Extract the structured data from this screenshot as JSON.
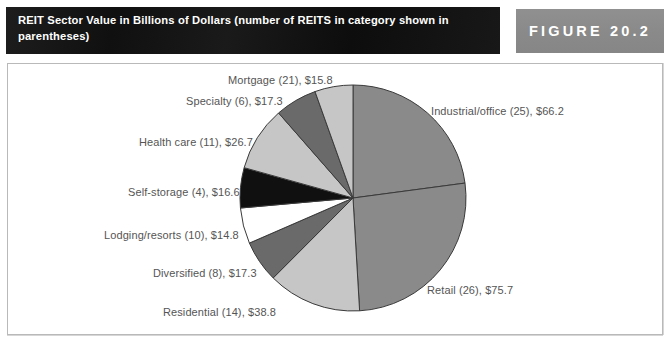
{
  "header": {
    "title": "REIT Sector Value in Billions of Dollars (number of REITS in category shown in parentheses)",
    "figure_label": "FIGURE 20.2"
  },
  "colors": {
    "title_bar": "#151515",
    "figure_box": "#8c8c8c",
    "frame_border": "#b9b9b9",
    "label_text": "#555555",
    "slice_stroke": "#3a3a3a",
    "medium_gray": "#8a8a8a",
    "light_gray": "#c6c6c6",
    "dark_gray": "#6a6a6a",
    "black": "#101010",
    "white": "#ffffff"
  },
  "labels": {
    "industrial": "Industrial/office (25), $66.2",
    "retail": "Retail (26), $75.7",
    "residential": "Residential (14), $38.8",
    "diversified": "Diversified (8), $17.3",
    "lodging": "Lodging/resorts (10), $14.8",
    "selfstorage": "Self-storage (4), $16.6",
    "healthcare": "Health care (11), $26.7",
    "specialty": "Specialty (6), $17.3",
    "mortgage": "Mortgage (21), $15.8"
  },
  "chart_data": {
    "type": "pie",
    "title": "REIT Sector Value in Billions of Dollars (number of REITS in category shown in parentheses)",
    "unit": "billions of dollars",
    "total": 289.2,
    "legend": "none (direct labels with leader placement)",
    "start_angle_deg": 0,
    "direction": "clockwise",
    "categories": [
      "Industrial/office",
      "Retail",
      "Residential",
      "Diversified",
      "Lodging/resorts",
      "Self-storage",
      "Health care",
      "Specialty",
      "Mortgage"
    ],
    "values": [
      66.2,
      75.7,
      38.8,
      17.3,
      14.8,
      16.6,
      26.7,
      17.3,
      15.8
    ],
    "counts": [
      25,
      26,
      14,
      8,
      10,
      4,
      11,
      6,
      21
    ],
    "slices": [
      {
        "name": "Industrial/office",
        "count": 25,
        "value": 66.2,
        "label": "Industrial/office (25), $66.2",
        "color": "#8a8a8a",
        "start_deg": 0.0,
        "sweep_deg": 82.41
      },
      {
        "name": "Retail",
        "count": 26,
        "value": 75.7,
        "label": "Retail (26), $75.7",
        "color": "#8a8a8a",
        "start_deg": 82.41,
        "sweep_deg": 94.24
      },
      {
        "name": "Residential",
        "count": 14,
        "value": 38.8,
        "label": "Residential (14), $38.8",
        "color": "#c6c6c6",
        "start_deg": 176.65,
        "sweep_deg": 48.3
      },
      {
        "name": "Diversified",
        "count": 8,
        "value": 17.3,
        "label": "Diversified (8), $17.3",
        "color": "#6a6a6a",
        "start_deg": 224.95,
        "sweep_deg": 21.54
      },
      {
        "name": "Lodging/resorts",
        "count": 10,
        "value": 14.8,
        "label": "Lodging/resorts (10), $14.8",
        "color": "#ffffff",
        "start_deg": 246.49,
        "sweep_deg": 18.42
      },
      {
        "name": "Self-storage",
        "count": 4,
        "value": 16.6,
        "label": "Self-storage (4), $16.6",
        "color": "#101010",
        "start_deg": 264.91,
        "sweep_deg": 20.66
      },
      {
        "name": "Health care",
        "count": 11,
        "value": 26.7,
        "label": "Health care (11), $26.7",
        "color": "#c6c6c6",
        "start_deg": 285.57,
        "sweep_deg": 33.24
      },
      {
        "name": "Specialty",
        "count": 6,
        "value": 17.3,
        "label": "Specialty (6), $17.3",
        "color": "#6a6a6a",
        "start_deg": 318.81,
        "sweep_deg": 21.54
      },
      {
        "name": "Mortgage",
        "count": 21,
        "value": 15.8,
        "label": "Mortgage (21), $15.8",
        "color": "#c6c6c6",
        "start_deg": 340.35,
        "sweep_deg": 19.67
      }
    ],
    "geometry": {
      "center_x": 353,
      "center_y": 198,
      "radius": 113
    }
  }
}
